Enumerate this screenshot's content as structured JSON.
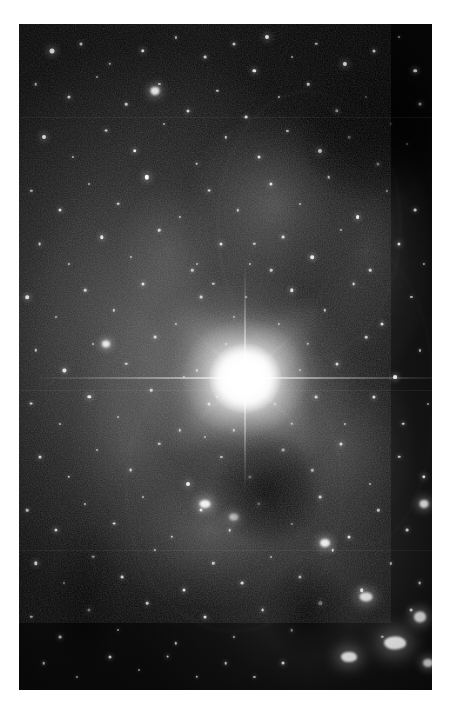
{
  "page": {
    "width": 461,
    "height": 708,
    "background_color": "#ffffff"
  },
  "plate": {
    "left": 19,
    "top": 24,
    "width": 413,
    "height": 666,
    "sky_color": "#0d0d0d",
    "star_color": "#ffffff",
    "nebula_color": "#969696",
    "dust_color": "#000000",
    "caption": ""
  },
  "chart_data": {
    "type": "scatter",
    "title": "",
    "xlabel": "",
    "ylabel": "",
    "xlim": [
      0,
      100
    ],
    "ylim": [
      0,
      100
    ],
    "grid": false,
    "legend": null,
    "note": "Positions are percentages of the photographic plate area; size is the apparent stellar disc diameter in pixels; brightness 0-1.",
    "bright_star": {
      "name": "central-bright-star",
      "x": 54.7,
      "y": 53.2,
      "core_diameter": 74,
      "halo_diameter": 330,
      "brightness": 1.0,
      "spikes": [
        {
          "name": "horizontal",
          "angle_deg": 0,
          "length": 430
        },
        {
          "name": "vertical",
          "angle_deg": 90,
          "length": 230
        },
        {
          "name": "diagonal-ne",
          "angle_deg": 42,
          "length": 150
        },
        {
          "name": "diagonal-nw",
          "angle_deg": -42,
          "length": 150
        }
      ]
    },
    "nebula_patches": [
      {
        "x": 62,
        "y": 27,
        "rx": 26,
        "ry": 17,
        "brightness": 0.42
      },
      {
        "x": 84,
        "y": 34,
        "rx": 20,
        "ry": 24,
        "brightness": 0.34
      },
      {
        "x": 46,
        "y": 76,
        "rx": 30,
        "ry": 14,
        "brightness": 0.4
      },
      {
        "x": 27,
        "y": 63,
        "rx": 17,
        "ry": 20,
        "brightness": 0.26
      },
      {
        "x": 78,
        "y": 63,
        "rx": 22,
        "ry": 16,
        "brightness": 0.3
      },
      {
        "x": 36,
        "y": 34,
        "rx": 15,
        "ry": 12,
        "brightness": 0.22
      }
    ],
    "dust_lanes": [
      {
        "x": 60,
        "y": 70,
        "rx": 16,
        "ry": 10,
        "opacity": 0.88
      },
      {
        "x": 86,
        "y": 16,
        "rx": 22,
        "ry": 13,
        "opacity": 0.9
      },
      {
        "x": 70,
        "y": 88,
        "rx": 13,
        "ry": 9,
        "opacity": 0.8
      },
      {
        "x": 16,
        "y": 86,
        "rx": 10,
        "ry": 14,
        "opacity": 0.62
      }
    ],
    "arcs": [
      {
        "x": 70,
        "y": 30,
        "rx": 22,
        "ry": 20,
        "opacity": 0.3
      },
      {
        "x": 52,
        "y": 70,
        "rx": 26,
        "ry": 21,
        "opacity": 0.26
      },
      {
        "x": 84,
        "y": 56,
        "rx": 16,
        "ry": 22,
        "opacity": 0.22
      }
    ],
    "seams": [
      {
        "y": 14
      },
      {
        "y": 55
      },
      {
        "y": 79
      }
    ],
    "bright_blobs": [
      {
        "x": 91,
        "y": 93,
        "w": 22,
        "h": 13,
        "brightness": 1.0
      },
      {
        "x": 80,
        "y": 95,
        "w": 16,
        "h": 10,
        "brightness": 0.95
      },
      {
        "x": 97,
        "y": 89,
        "w": 12,
        "h": 11,
        "brightness": 0.92
      },
      {
        "x": 84,
        "y": 86,
        "w": 13,
        "h": 9,
        "brightness": 0.9
      },
      {
        "x": 74,
        "y": 78,
        "w": 10,
        "h": 8,
        "brightness": 0.9
      },
      {
        "x": 45,
        "y": 72,
        "w": 11,
        "h": 8,
        "brightness": 0.95
      },
      {
        "x": 52,
        "y": 74,
        "w": 9,
        "h": 7,
        "brightness": 0.9
      },
      {
        "x": 98,
        "y": 72,
        "w": 9,
        "h": 8,
        "brightness": 0.88
      },
      {
        "x": 21,
        "y": 48,
        "w": 8,
        "h": 7,
        "brightness": 0.9
      },
      {
        "x": 33,
        "y": 10,
        "w": 9,
        "h": 8,
        "brightness": 0.92
      },
      {
        "x": 99,
        "y": 96,
        "w": 10,
        "h": 8,
        "brightness": 0.9
      }
    ],
    "stars": [
      [
        8,
        4,
        5.0,
        1.0
      ],
      [
        15,
        3,
        3.0,
        0.8
      ],
      [
        22,
        6,
        2.5,
        0.7
      ],
      [
        30,
        4,
        3.5,
        0.9
      ],
      [
        38,
        2,
        2.2,
        0.7
      ],
      [
        45,
        5,
        2.8,
        0.8
      ],
      [
        52,
        3,
        3.0,
        0.8
      ],
      [
        60,
        2,
        4.0,
        0.95
      ],
      [
        57,
        7,
        3.4,
        0.9
      ],
      [
        66,
        5,
        2.0,
        0.6
      ],
      [
        72,
        3,
        2.4,
        0.7
      ],
      [
        79,
        6,
        4.2,
        0.95
      ],
      [
        86,
        4,
        3.0,
        0.85
      ],
      [
        92,
        2,
        2.0,
        0.6
      ],
      [
        96,
        7,
        3.6,
        0.9
      ],
      [
        4,
        9,
        2.6,
        0.75
      ],
      [
        12,
        11,
        3.2,
        0.85
      ],
      [
        19,
        8,
        2.0,
        0.6
      ],
      [
        26,
        12,
        2.6,
        0.75
      ],
      [
        34,
        9,
        2.2,
        0.65
      ],
      [
        41,
        13,
        3.0,
        0.8
      ],
      [
        48,
        10,
        2.4,
        0.7
      ],
      [
        55,
        14,
        2.8,
        0.8
      ],
      [
        63,
        11,
        2.2,
        0.65
      ],
      [
        70,
        9,
        2.6,
        0.75
      ],
      [
        77,
        13,
        3.4,
        0.9
      ],
      [
        84,
        11,
        2.0,
        0.6
      ],
      [
        90,
        15,
        2.4,
        0.7
      ],
      [
        97,
        12,
        3.0,
        0.85
      ],
      [
        6,
        17,
        4.0,
        0.95
      ],
      [
        13,
        20,
        2.2,
        0.65
      ],
      [
        21,
        16,
        2.8,
        0.8
      ],
      [
        28,
        19,
        3.6,
        0.9
      ],
      [
        35,
        15,
        2.0,
        0.6
      ],
      [
        43,
        21,
        2.6,
        0.75
      ],
      [
        50,
        17,
        2.4,
        0.7
      ],
      [
        58,
        20,
        3.0,
        0.85
      ],
      [
        65,
        16,
        2.2,
        0.65
      ],
      [
        73,
        19,
        4.0,
        0.95
      ],
      [
        80,
        17,
        2.6,
        0.75
      ],
      [
        87,
        21,
        3.2,
        0.85
      ],
      [
        94,
        18,
        2.0,
        0.6
      ],
      [
        3,
        25,
        2.4,
        0.7
      ],
      [
        10,
        28,
        3.0,
        0.85
      ],
      [
        17,
        24,
        2.0,
        0.6
      ],
      [
        24,
        27,
        2.6,
        0.75
      ],
      [
        31,
        23,
        4.4,
        0.98
      ],
      [
        39,
        29,
        2.2,
        0.65
      ],
      [
        46,
        25,
        2.8,
        0.8
      ],
      [
        53,
        28,
        2.4,
        0.7
      ],
      [
        61,
        24,
        3.2,
        0.85
      ],
      [
        68,
        27,
        2.0,
        0.6
      ],
      [
        75,
        23,
        2.6,
        0.75
      ],
      [
        82,
        29,
        3.8,
        0.92
      ],
      [
        89,
        25,
        2.2,
        0.65
      ],
      [
        96,
        28,
        2.8,
        0.8
      ],
      [
        5,
        33,
        2.8,
        0.8
      ],
      [
        12,
        36,
        2.2,
        0.65
      ],
      [
        20,
        32,
        3.4,
        0.88
      ],
      [
        27,
        35,
        2.0,
        0.6
      ],
      [
        34,
        31,
        2.6,
        0.75
      ],
      [
        42,
        37,
        2.4,
        0.7
      ],
      [
        49,
        33,
        3.0,
        0.85
      ],
      [
        56,
        36,
        2.2,
        0.65
      ],
      [
        64,
        32,
        2.8,
        0.8
      ],
      [
        71,
        35,
        3.6,
        0.9
      ],
      [
        78,
        31,
        2.0,
        0.6
      ],
      [
        85,
        37,
        2.6,
        0.75
      ],
      [
        92,
        33,
        3.2,
        0.85
      ],
      [
        98,
        36,
        2.2,
        0.65
      ],
      [
        2,
        41,
        3.6,
        0.9
      ],
      [
        9,
        44,
        2.0,
        0.6
      ],
      [
        16,
        40,
        2.6,
        0.75
      ],
      [
        23,
        43,
        2.4,
        0.7
      ],
      [
        30,
        39,
        3.0,
        0.85
      ],
      [
        38,
        45,
        2.2,
        0.65
      ],
      [
        44,
        41,
        2.8,
        0.8
      ],
      [
        52,
        44,
        2.0,
        0.6
      ],
      [
        66,
        40,
        3.4,
        0.88
      ],
      [
        74,
        43,
        2.4,
        0.7
      ],
      [
        81,
        39,
        2.8,
        0.8
      ],
      [
        88,
        45,
        3.0,
        0.85
      ],
      [
        95,
        41,
        2.2,
        0.65
      ],
      [
        4,
        49,
        2.4,
        0.7
      ],
      [
        11,
        52,
        3.2,
        0.86
      ],
      [
        18,
        48,
        2.0,
        0.6
      ],
      [
        26,
        51,
        2.6,
        0.75
      ],
      [
        33,
        47,
        2.8,
        0.8
      ],
      [
        40,
        53,
        2.2,
        0.65
      ],
      [
        70,
        48,
        2.4,
        0.7
      ],
      [
        77,
        51,
        3.0,
        0.85
      ],
      [
        84,
        47,
        2.6,
        0.75
      ],
      [
        91,
        53,
        3.8,
        0.92
      ],
      [
        97,
        49,
        2.2,
        0.65
      ],
      [
        3,
        57,
        2.8,
        0.8
      ],
      [
        10,
        60,
        2.2,
        0.65
      ],
      [
        17,
        56,
        3.4,
        0.88
      ],
      [
        24,
        59,
        2.0,
        0.6
      ],
      [
        32,
        55,
        2.6,
        0.75
      ],
      [
        39,
        61,
        2.4,
        0.7
      ],
      [
        46,
        57,
        3.0,
        0.85
      ],
      [
        72,
        56,
        2.8,
        0.8
      ],
      [
        79,
        60,
        2.2,
        0.65
      ],
      [
        86,
        56,
        3.2,
        0.86
      ],
      [
        93,
        60,
        2.6,
        0.75
      ],
      [
        99,
        57,
        2.0,
        0.6
      ],
      [
        5,
        65,
        3.0,
        0.85
      ],
      [
        12,
        68,
        2.4,
        0.7
      ],
      [
        19,
        64,
        2.0,
        0.6
      ],
      [
        27,
        67,
        2.8,
        0.8
      ],
      [
        34,
        63,
        2.6,
        0.75
      ],
      [
        41,
        69,
        4.0,
        0.95
      ],
      [
        49,
        65,
        2.2,
        0.65
      ],
      [
        56,
        68,
        3.2,
        0.86
      ],
      [
        64,
        64,
        2.8,
        0.8
      ],
      [
        71,
        67,
        2.4,
        0.7
      ],
      [
        78,
        63,
        3.0,
        0.85
      ],
      [
        85,
        69,
        2.0,
        0.6
      ],
      [
        92,
        65,
        2.6,
        0.75
      ],
      [
        98,
        68,
        3.4,
        0.88
      ],
      [
        2,
        73,
        2.6,
        0.75
      ],
      [
        9,
        76,
        3.2,
        0.86
      ],
      [
        16,
        72,
        2.2,
        0.65
      ],
      [
        23,
        75,
        2.8,
        0.8
      ],
      [
        30,
        71,
        2.0,
        0.6
      ],
      [
        37,
        77,
        2.4,
        0.7
      ],
      [
        44,
        73,
        3.0,
        0.85
      ],
      [
        51,
        76,
        2.6,
        0.75
      ],
      [
        58,
        72,
        3.6,
        0.9
      ],
      [
        66,
        75,
        2.2,
        0.65
      ],
      [
        73,
        71,
        2.8,
        0.8
      ],
      [
        80,
        77,
        3.0,
        0.85
      ],
      [
        87,
        73,
        2.4,
        0.7
      ],
      [
        94,
        76,
        2.8,
        0.8
      ],
      [
        4,
        81,
        3.4,
        0.88
      ],
      [
        11,
        84,
        2.0,
        0.6
      ],
      [
        18,
        80,
        2.6,
        0.75
      ],
      [
        25,
        83,
        2.8,
        0.8
      ],
      [
        33,
        79,
        2.2,
        0.65
      ],
      [
        40,
        85,
        3.0,
        0.85
      ],
      [
        47,
        81,
        2.4,
        0.7
      ],
      [
        54,
        84,
        2.8,
        0.8
      ],
      [
        61,
        80,
        2.0,
        0.6
      ],
      [
        68,
        83,
        3.2,
        0.86
      ],
      [
        76,
        79,
        2.6,
        0.75
      ],
      [
        83,
        85,
        3.6,
        0.9
      ],
      [
        90,
        81,
        2.2,
        0.65
      ],
      [
        97,
        84,
        2.8,
        0.8
      ],
      [
        3,
        89,
        2.4,
        0.7
      ],
      [
        10,
        92,
        2.8,
        0.8
      ],
      [
        17,
        88,
        3.2,
        0.86
      ],
      [
        24,
        91,
        2.0,
        0.6
      ],
      [
        31,
        87,
        2.6,
        0.75
      ],
      [
        38,
        93,
        2.4,
        0.7
      ],
      [
        45,
        89,
        3.0,
        0.85
      ],
      [
        52,
        92,
        2.2,
        0.65
      ],
      [
        59,
        88,
        2.8,
        0.8
      ],
      [
        66,
        91,
        2.6,
        0.75
      ],
      [
        73,
        87,
        3.4,
        0.88
      ],
      [
        88,
        92,
        2.4,
        0.7
      ],
      [
        95,
        88,
        2.8,
        0.8
      ],
      [
        6,
        96,
        2.6,
        0.75
      ],
      [
        14,
        98,
        2.2,
        0.65
      ],
      [
        22,
        95,
        3.0,
        0.85
      ],
      [
        29,
        97,
        2.0,
        0.6
      ],
      [
        36,
        95,
        2.8,
        0.8
      ],
      [
        43,
        98,
        2.4,
        0.7
      ],
      [
        50,
        96,
        2.6,
        0.75
      ],
      [
        57,
        98,
        2.2,
        0.65
      ],
      [
        64,
        96,
        3.0,
        0.85
      ],
      [
        43,
        36,
        2.0,
        0.6
      ],
      [
        47,
        39,
        2.4,
        0.7
      ],
      [
        61,
        37,
        2.6,
        0.75
      ],
      [
        63,
        45,
        2.2,
        0.65
      ],
      [
        50,
        48,
        2.0,
        0.6
      ],
      [
        59,
        50,
        1.8,
        0.55
      ],
      [
        48,
        56,
        2.2,
        0.65
      ],
      [
        62,
        57,
        2.0,
        0.6
      ],
      [
        55,
        41,
        1.8,
        0.55
      ],
      [
        52,
        61,
        2.4,
        0.7
      ],
      [
        68,
        52,
        2.0,
        0.6
      ],
      [
        43,
        52,
        2.2,
        0.65
      ],
      [
        57,
        33,
        2.4,
        0.7
      ],
      [
        66,
        60,
        2.6,
        0.75
      ],
      [
        45,
        62,
        2.0,
        0.6
      ]
    ]
  }
}
